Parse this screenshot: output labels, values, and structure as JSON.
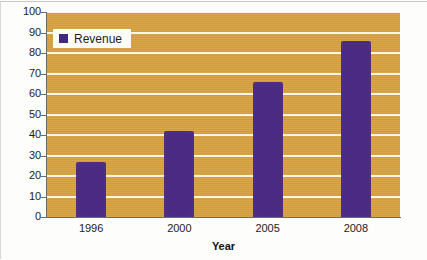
{
  "chart_data": {
    "type": "bar",
    "title": "",
    "categories": [
      "1996",
      "2000",
      "2005",
      "2008"
    ],
    "values": [
      27,
      42,
      66,
      86
    ],
    "series": [
      {
        "name": "Revenue",
        "values": [
          27,
          42,
          66,
          86
        ]
      }
    ],
    "xlabel": "Year",
    "ylabel": "",
    "ylim": [
      0,
      100
    ],
    "ytick_labels": [
      "100",
      "90",
      "80",
      "70",
      "60",
      "50",
      "40",
      "30",
      "20",
      "10",
      "0"
    ],
    "ytick_values": [
      100,
      90,
      80,
      70,
      60,
      50,
      40,
      30,
      20,
      10,
      0
    ],
    "ytick_step": 10,
    "grid": true,
    "grid_axis": "y",
    "legend": {
      "position": "top-left",
      "entries": [
        {
          "label": "Revenue",
          "color": "#42277E"
        }
      ]
    },
    "colors": {
      "bar": "#4A2A82",
      "plot_background": "#D7A241",
      "gridline": "#FDF6E6",
      "axis": "#6B6B66",
      "text": "#1C1C1C",
      "figure_background": "#FDFDFB"
    }
  }
}
